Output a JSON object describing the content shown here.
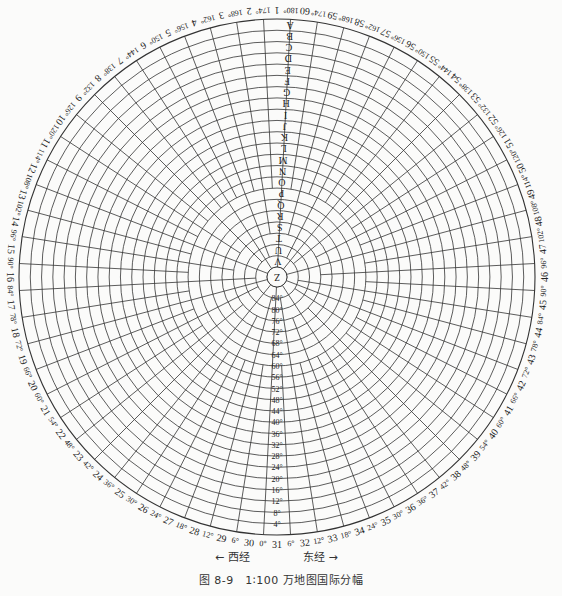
{
  "figure": {
    "caption": "图 8-9　1∶100 万地图国际分幅",
    "west_label": "← 西经",
    "east_label": "东经 →"
  },
  "map": {
    "type": "polar-grid",
    "center": [
      277,
      277
    ],
    "outer_radius": 258,
    "center_radius": 10,
    "ring_step_degrees": 4,
    "column_step_degrees": 6,
    "line_color": "#333333",
    "background": "#fbfbfa",
    "center_zone_label": "Z",
    "row_letters": [
      "A",
      "B",
      "C",
      "D",
      "E",
      "F",
      "G",
      "H",
      "I",
      "J",
      "K",
      "L",
      "M",
      "N",
      "O",
      "P",
      "Q",
      "R",
      "S",
      "T",
      "U",
      "V"
    ],
    "latitude_labels": [
      "4°",
      "8°",
      "12°",
      "16°",
      "20°",
      "24°",
      "28°",
      "32°",
      "36°",
      "40°",
      "44°",
      "48°",
      "52°",
      "56°",
      "60°",
      "64°",
      "68°",
      "72°",
      "76°",
      "80°",
      "84°"
    ],
    "column_numbers": [
      1,
      2,
      3,
      4,
      5,
      6,
      7,
      8,
      9,
      10,
      11,
      12,
      13,
      14,
      15,
      16,
      17,
      18,
      19,
      20,
      21,
      22,
      23,
      24,
      25,
      26,
      27,
      28,
      29,
      30,
      31,
      32,
      33,
      34,
      35,
      36,
      37,
      38,
      39,
      40,
      41,
      42,
      43,
      44,
      45,
      46,
      47,
      48,
      49,
      50,
      51,
      52,
      53,
      54,
      55,
      56,
      57,
      58,
      59,
      60
    ],
    "meridian_labels": [
      "180°",
      "174°",
      "168°",
      "162°",
      "156°",
      "150°",
      "144°",
      "138°",
      "132°",
      "126°",
      "120°",
      "114°",
      "108°",
      "102°",
      "96°",
      "90°",
      "84°",
      "78°",
      "72°",
      "66°",
      "60°",
      "54°",
      "48°",
      "42°",
      "36°",
      "30°",
      "24°",
      "18°",
      "12°",
      "6°",
      "0°",
      "6°",
      "12°",
      "18°",
      "24°",
      "30°",
      "36°",
      "42°",
      "48°",
      "54°",
      "60°",
      "66°",
      "72°",
      "78°",
      "84°",
      "90°",
      "96°",
      "102°",
      "108°",
      "114°",
      "120°",
      "126°",
      "132°",
      "138°",
      "144°",
      "150°",
      "156°",
      "162°",
      "168°",
      "174°"
    ]
  }
}
